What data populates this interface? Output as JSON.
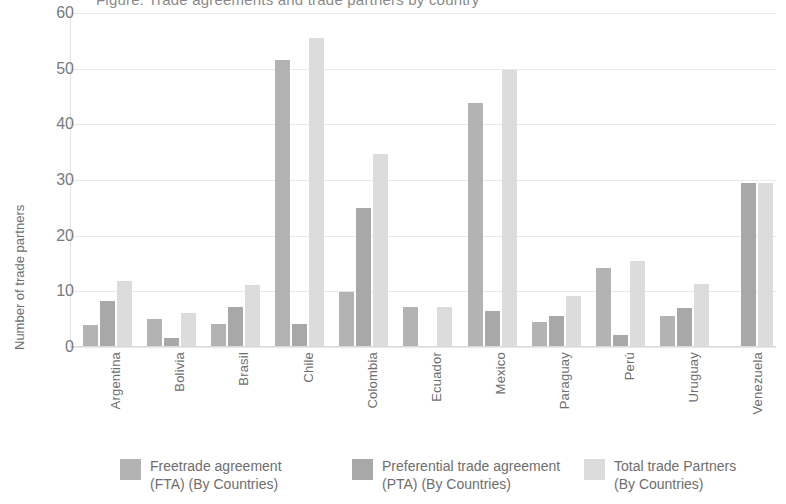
{
  "title": "Figure: Trade agreements and trade partners by country",
  "chart_data": {
    "type": "bar",
    "title": "Figure: Trade agreements and trade partners by country",
    "xlabel": "",
    "ylabel": "Number of trade partners",
    "ylim": [
      0,
      60
    ],
    "yticks": [
      0,
      10,
      20,
      30,
      40,
      50,
      60
    ],
    "grid": true,
    "legend_position": "bottom",
    "categories": [
      "Argentina",
      "Bolivia",
      "Brasil",
      "Chile",
      "Colombia",
      "Ecuador",
      "Mexico",
      "Paraguay",
      "Perú",
      "Uruguay",
      "Venezuela"
    ],
    "series": [
      {
        "name": "Freetrade agreement (FTA) (By Countries)",
        "color": "#b3b3b3",
        "values": [
          3.8,
          4.8,
          4.0,
          51.4,
          9.7,
          7.0,
          43.7,
          4.3,
          14.0,
          5.4,
          0
        ]
      },
      {
        "name": "Preferential trade agreement (PTA) (By Countries)",
        "color": "#a8a8a8",
        "values": [
          8.0,
          1.4,
          7.0,
          4.0,
          24.8,
          0,
          6.3,
          5.4,
          2.0,
          6.8,
          29.3
        ]
      },
      {
        "name": "Total trade Partners (By Countries)",
        "color": "#dcdcdc",
        "values": [
          11.6,
          6.0,
          11.0,
          55.4,
          34.5,
          7.0,
          49.6,
          9.0,
          15.2,
          11.2,
          29.3
        ]
      }
    ]
  },
  "axis": {
    "y_title": "Number of trade partners",
    "y_ticks": [
      "60",
      "50",
      "40",
      "30",
      "20",
      "10",
      "0"
    ],
    "x_ticks": [
      "Argentina",
      "Bolivia",
      "Brasil",
      "Chile",
      "Colombia",
      "Ecuador",
      "Mexico",
      "Paraguay",
      "Perú",
      "Uruguay",
      "Venezuela"
    ]
  },
  "legend": {
    "items": [
      {
        "label": "Freetrade agreement\n(FTA) (By Countries)",
        "color": "#b3b3b3",
        "key": "fta"
      },
      {
        "label": "Preferential trade agreement\n(PTA) (By Countries)",
        "color": "#a8a8a8",
        "key": "pta"
      },
      {
        "label": "Total trade Partners\n(By Countries)",
        "color": "#dcdcdc",
        "key": "total"
      }
    ]
  },
  "colors": {
    "fta": "#b3b3b3",
    "pta": "#a8a8a8",
    "total": "#dcdcdc",
    "grid": "#e9e9e9",
    "text": "#6e6e6e",
    "background": "#ffffff"
  }
}
